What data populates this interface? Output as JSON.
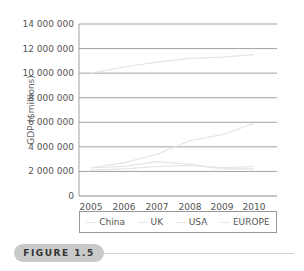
{
  "chart_data": {
    "type": "line",
    "title": "",
    "xlabel": "",
    "ylabel": "GDP ($millions)",
    "x": [
      "2005",
      "2006",
      "2007",
      "2008",
      "2009",
      "2010"
    ],
    "y_ticks": [
      "0",
      "2 000 000",
      "4 000 000",
      "6 000 000",
      "8 000 000",
      "10 000 000",
      "12 000 000",
      "14 000 000"
    ],
    "ylim": [
      0,
      14000000
    ],
    "grid": true,
    "legend_position": "bottom",
    "series": [
      {
        "name": "China",
        "values": [
          2300000,
          2700000,
          3400000,
          4500000,
          5000000,
          5900000
        ]
      },
      {
        "name": "UK",
        "values": [
          2300000,
          2400000,
          2800000,
          2600000,
          2200000,
          2200000
        ]
      },
      {
        "name": "USA",
        "values": [
          10000000,
          10500000,
          10900000,
          11200000,
          11300000,
          11500000
        ]
      },
      {
        "name": "EUROPE",
        "values": [
          2100000,
          2200000,
          2400000,
          2500000,
          2300000,
          2400000
        ]
      }
    ]
  },
  "legend": [
    "China",
    "UK",
    "USA",
    "EUROPE"
  ],
  "figure_label": "FIGURE 1.5",
  "colors": {
    "series": "#e4e4e4",
    "grid": "#8a8a8a",
    "badge": "#c9c9c9"
  }
}
